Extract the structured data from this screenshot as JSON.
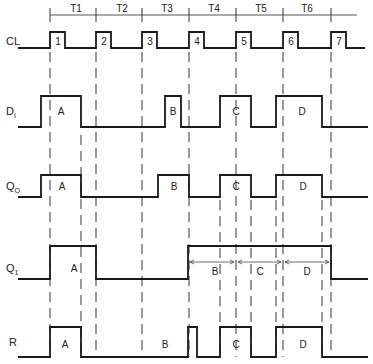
{
  "period_labels": [
    "T1",
    "T2",
    "T3",
    "T4",
    "T5",
    "T6"
  ],
  "clock_pulse_labels": [
    "1",
    "2",
    "3",
    "4",
    "5",
    "6",
    "7"
  ],
  "signals": {
    "cl": {
      "name": "CL",
      "sub": ""
    },
    "di": {
      "name": "D",
      "sub": "I"
    },
    "qo": {
      "name": "Q",
      "sub": "O"
    },
    "q1": {
      "name": "Q",
      "sub": "1"
    },
    "r": {
      "name": "R",
      "sub": ""
    }
  },
  "di_pulses": [
    "A",
    "B",
    "C",
    "D"
  ],
  "qo_pulses": [
    "A",
    "B",
    "C",
    "D"
  ],
  "q1_pulses": [
    "A"
  ],
  "q1_spans": [
    "B",
    "C",
    "D"
  ],
  "r_pulses": [
    "A",
    "B",
    "C",
    "D"
  ]
}
